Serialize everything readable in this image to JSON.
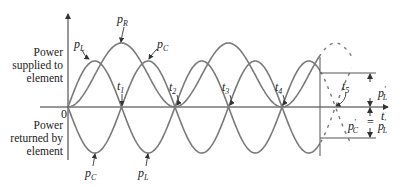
{
  "figure": {
    "axis_labels": {
      "origin": "0",
      "time": "t",
      "positive_region": [
        "Power",
        "supplied to",
        "element"
      ],
      "negative_region": [
        "Power",
        "returned by",
        "element"
      ]
    },
    "curve_labels": {
      "p_R": {
        "base": "p",
        "sub": "R"
      },
      "p_L_top": {
        "base": "p",
        "sub": "L"
      },
      "p_C_top": {
        "base": "p",
        "sub": "C"
      },
      "p_C_bottom": {
        "base": "p",
        "sub": "C"
      },
      "p_L_bottom": {
        "base": "p",
        "sub": "L"
      }
    },
    "time_markers": [
      {
        "base": "t",
        "sub": "1"
      },
      {
        "base": "t",
        "sub": "2"
      },
      {
        "base": "t",
        "sub": "3"
      },
      {
        "base": "t",
        "sub": "4"
      },
      {
        "base": "t",
        "sub": "5"
      }
    ],
    "dimension_labels": {
      "upper": {
        "base": "p",
        "prime": "′",
        "sub": "L"
      },
      "lower_left": {
        "base": "p",
        "prime": "′",
        "sub": "C"
      },
      "equals": "=",
      "lower_right": {
        "base": "p",
        "prime": "′",
        "sub": "L"
      }
    },
    "colors": {
      "curve": "#7a7a7a",
      "axis": "#333333",
      "text": "#222222"
    }
  }
}
